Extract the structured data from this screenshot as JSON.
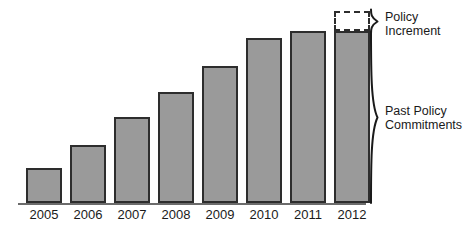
{
  "chart_data": {
    "type": "bar",
    "title": "",
    "subtitle": "",
    "xlabel": "",
    "ylabel": "",
    "grid": false,
    "legend_position": "right",
    "categories": [
      "2005",
      "2006",
      "2007",
      "2008",
      "2009",
      "2010",
      "2011",
      "2012"
    ],
    "series": [
      {
        "name": "Past Policy Commitments",
        "values": [
          35,
          58,
          86,
          111,
          137,
          165,
          172,
          172
        ]
      },
      {
        "name": "Policy Increment",
        "values": [
          0,
          0,
          0,
          0,
          0,
          0,
          0,
          20
        ]
      }
    ],
    "ylim": [
      0,
      192
    ],
    "annotations": [
      {
        "name": "policy-increment-bracket",
        "text": "Policy Increment"
      },
      {
        "name": "past-policy-commitments-bracket",
        "text": "Past Policy Commitments"
      }
    ]
  },
  "chart": {
    "axis": {
      "tick_labels": [
        "2005",
        "2006",
        "2007",
        "2008",
        "2009",
        "2010",
        "2011",
        "2012"
      ]
    },
    "brackets": {
      "policy_increment": {
        "line1": "Policy",
        "line2": "Increment"
      },
      "past_policy": {
        "line1": "Past Policy",
        "line2": "Commitments"
      }
    },
    "colors": {
      "bar_fill": "#9a9a9a",
      "bar_stroke": "#2d2d2d",
      "increment_fill": "#ffffff",
      "axis": "#6b6b6b",
      "text": "#1a1a1a"
    }
  }
}
